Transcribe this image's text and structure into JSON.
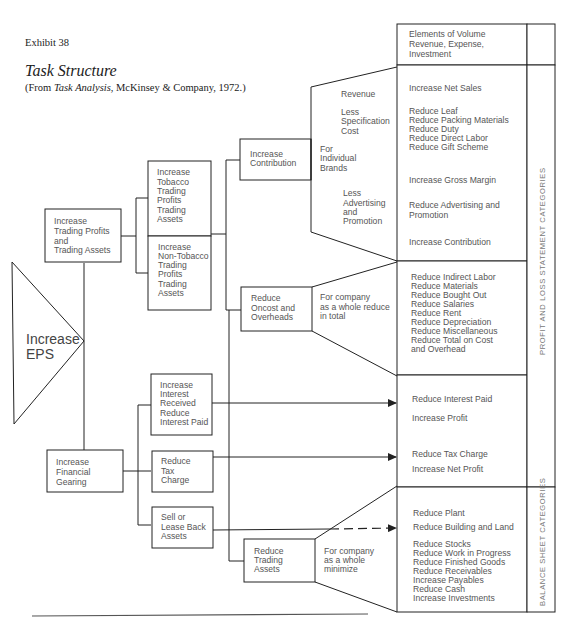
{
  "header": {
    "exhibit": "Exhibit 38",
    "title": "Task Structure",
    "subtitle_prefix": "(From ",
    "subtitle_source": "Task Analysis",
    "subtitle_suffix": ", McKinsey & Company, 1972.)"
  },
  "root": {
    "lines": [
      "Increase",
      "EPS"
    ]
  },
  "level1": {
    "trading": [
      "Increase",
      "Trading Profits",
      "and",
      "Trading Assets"
    ],
    "financial": [
      "Increase",
      "Financial",
      "Gearing"
    ]
  },
  "level2": {
    "tobacco": [
      "Increase",
      "Tobacco",
      "Trading",
      "Profits",
      "Trading",
      "Assets"
    ],
    "non_tobacco": [
      "Increase",
      "Non-Tobacco",
      "Trading",
      "Profits",
      "Trading",
      "Assets"
    ],
    "interest": [
      "Increase",
      "Interest",
      "Received",
      "Reduce",
      "Interest Paid"
    ],
    "tax": [
      "Reduce",
      "Tax",
      "Charge"
    ],
    "lease": [
      "Sell or",
      "Lease Back",
      "Assets"
    ]
  },
  "level3": {
    "contribution": [
      "Increase",
      "Contribution"
    ],
    "oncost": [
      "Reduce",
      "Oncost and",
      "Overheads"
    ],
    "trading_assets": [
      "Reduce",
      "Trading",
      "Assets"
    ]
  },
  "funnels": {
    "brands": {
      "revenue": "Revenue",
      "spec": [
        "Less",
        "Specification",
        "Cost"
      ],
      "scope": [
        "For",
        "Individual",
        "Brands"
      ],
      "adv": [
        "Less",
        "Advertising",
        "and",
        "Promotion"
      ]
    },
    "oncost_scope": [
      "For company",
      "as a whole reduce",
      "in total"
    ],
    "assets_scope": [
      "For company",
      "as a whole",
      "minimize"
    ]
  },
  "elements_table": {
    "header": [
      "Elements of Volume",
      "Revenue, Expense,",
      "Investment"
    ],
    "pl_section": {
      "net_sales": "Increase Net Sales",
      "spec_items": [
        "Reduce Leaf",
        "Reduce Packing Materials",
        "Reduce Duty",
        "Reduce Direct Labor",
        "Reduce Gift Scheme"
      ],
      "gross_margin": "Increase Gross Margin",
      "adv": [
        "Reduce Advertising and",
        "Promotion"
      ],
      "contribution": "Increase Contribution",
      "overheads": [
        "Reduce Indirect Labor",
        "Reduce Materials",
        "Reduce Bought Out",
        "Reduce Salaries",
        "Reduce Rent",
        "Reduce Depreciation",
        "Reduce Miscellaneous",
        "Reduce Total on Cost",
        "and Overhead"
      ],
      "interest": [
        "Reduce Interest Paid",
        "Increase Profit"
      ],
      "tax": [
        "Reduce Tax Charge",
        "Increase Net Profit"
      ]
    },
    "bs_section": {
      "plant": "Reduce Plant",
      "building": "Reduce Building and Land",
      "working_capital": [
        "Reduce Stocks",
        "Reduce Work in Progress",
        "Reduce Finished Goods",
        "Reduce Receivables",
        "Increase Payables",
        "Reduce Cash",
        "Increase Investments"
      ]
    },
    "side_labels": {
      "pl": "PROFIT AND LOSS STATEMENT CATEGORIES",
      "bs": "BALANCE SHEET CATEGORIES"
    }
  }
}
